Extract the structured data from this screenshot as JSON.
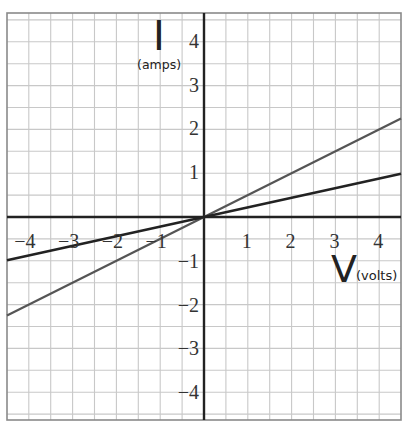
{
  "chart_data": {
    "type": "line",
    "title": "",
    "xlabel": "V",
    "xlabel_unit": "(volts)",
    "ylabel": "I",
    "ylabel_unit": "(amps)",
    "xlim": [
      -4.5,
      4.5
    ],
    "ylim": [
      -4.5,
      4.5
    ],
    "grid": true,
    "grid_step": 0.5,
    "x_ticks": [
      -4,
      -3,
      -2,
      -1,
      1,
      2,
      3,
      4
    ],
    "x_tick_labels": [
      "−4",
      "−3",
      "−2",
      "−1",
      "1",
      "2",
      "3",
      "4"
    ],
    "y_ticks": [
      4,
      3,
      2,
      1,
      -1,
      -2,
      -3,
      -4
    ],
    "y_tick_labels": [
      "4",
      "3",
      "2",
      "1",
      "−1",
      "−2",
      "−3",
      "−4"
    ],
    "legend": null,
    "series": [
      {
        "name": "steeper line",
        "x": [
          -4.5,
          4.5
        ],
        "y": [
          -2.27,
          2.27
        ],
        "slope": 0.5,
        "color": "#555555"
      },
      {
        "name": "shallower line",
        "x": [
          -4.5,
          4.5
        ],
        "y": [
          -1.0,
          1.0
        ],
        "slope": 0.22,
        "color": "#222222"
      }
    ]
  },
  "colors": {
    "grid": "#c8c8c8",
    "border": "#888888",
    "axis": "#222222"
  }
}
